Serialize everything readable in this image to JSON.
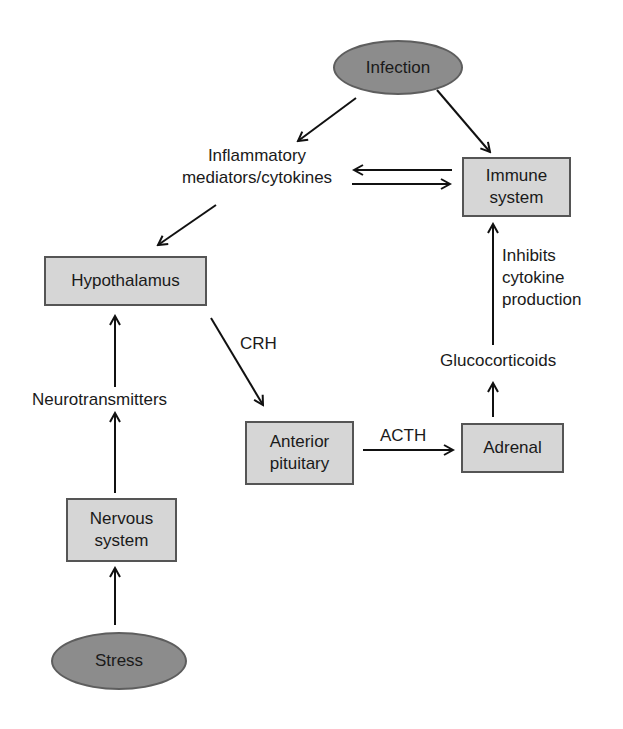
{
  "diagram": {
    "nodes": {
      "infection": {
        "label": "Infection",
        "shape": "ellipse"
      },
      "immune_system": {
        "label": "Immune\nsystem",
        "shape": "box"
      },
      "hypothalamus": {
        "label": "Hypothalamus",
        "shape": "box"
      },
      "anterior_pituitary": {
        "label": "Anterior\npituitary",
        "shape": "box"
      },
      "adrenal": {
        "label": "Adrenal",
        "shape": "box"
      },
      "nervous_system": {
        "label": "Nervous\nsystem",
        "shape": "box"
      },
      "stress": {
        "label": "Stress",
        "shape": "ellipse"
      }
    },
    "labels": {
      "inflammatory": "Inflammatory\nmediators/cytokines",
      "crh": "CRH",
      "acth": "ACTH",
      "glucocorticoids": "Glucocorticoids",
      "inhibits": "Inhibits\ncytokine\nproduction",
      "neurotransmitters": "Neurotransmitters"
    },
    "edges": [
      {
        "from": "Infection",
        "to": "Inflammatory mediators/cytokines"
      },
      {
        "from": "Infection",
        "to": "Immune system"
      },
      {
        "from": "Inflammatory mediators/cytokines",
        "to": "Immune system"
      },
      {
        "from": "Immune system",
        "to": "Inflammatory mediators/cytokines"
      },
      {
        "from": "Inflammatory mediators/cytokines",
        "to": "Hypothalamus"
      },
      {
        "from": "Hypothalamus",
        "to": "Anterior pituitary",
        "label": "CRH"
      },
      {
        "from": "Anterior pituitary",
        "to": "Adrenal",
        "label": "ACTH"
      },
      {
        "from": "Adrenal",
        "to": "Glucocorticoids"
      },
      {
        "from": "Glucocorticoids",
        "to": "Immune system",
        "label": "Inhibits cytokine production"
      },
      {
        "from": "Stress",
        "to": "Nervous system"
      },
      {
        "from": "Nervous system",
        "to": "Neurotransmitters"
      },
      {
        "from": "Neurotransmitters",
        "to": "Hypothalamus"
      }
    ],
    "colors": {
      "box_fill": "#d6d6d6",
      "box_border": "#555555",
      "ellipse_fill": "#8c8c8c",
      "line": "#111111"
    }
  }
}
